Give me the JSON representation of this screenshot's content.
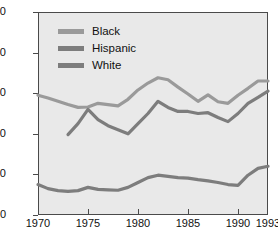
{
  "chart_data": {
    "type": "line",
    "title": "",
    "xlabel": "",
    "ylabel": "Percent of Group Living in Poverty",
    "xlim": [
      1970,
      1993
    ],
    "ylim": [
      0,
      50
    ],
    "yticks": [
      0,
      10,
      20,
      30,
      40,
      50
    ],
    "xticks": [
      1970,
      1975,
      1980,
      1985,
      1990,
      1993
    ],
    "grid": false,
    "legend_position": "top-left",
    "colors": {
      "black": "#9a9a9a",
      "hispanic": "#7d7d7d",
      "white": "#7d7d7d",
      "axis": "#4a4a4a",
      "plot_background": "#e9e9e9",
      "page_background": "#ffffff",
      "text": "#111111"
    },
    "series": [
      {
        "name": "Black",
        "x": [
          1970,
          1971,
          1972,
          1973,
          1974,
          1975,
          1976,
          1977,
          1978,
          1979,
          1980,
          1981,
          1982,
          1983,
          1984,
          1985,
          1986,
          1987,
          1988,
          1989,
          1990,
          1991,
          1992,
          1993
        ],
        "values": [
          29.5,
          28.8,
          28.0,
          27.2,
          26.5,
          26.6,
          27.5,
          27.2,
          26.9,
          28.5,
          30.8,
          32.5,
          33.8,
          33.3,
          31.5,
          29.8,
          28.0,
          29.6,
          27.9,
          27.5,
          29.5,
          31.2,
          33.0,
          33.0
        ]
      },
      {
        "name": "Hispanic",
        "x": [
          1973,
          1974,
          1975,
          1976,
          1977,
          1978,
          1979,
          1980,
          1981,
          1982,
          1983,
          1984,
          1985,
          1986,
          1987,
          1988,
          1989,
          1990,
          1991,
          1992,
          1993
        ],
        "values": [
          19.8,
          22.5,
          26.0,
          23.5,
          22.0,
          21.0,
          20.0,
          22.5,
          25.0,
          28.0,
          26.5,
          25.5,
          25.5,
          25.0,
          25.2,
          24.0,
          23.0,
          25.0,
          27.5,
          29.0,
          30.5
        ]
      },
      {
        "name": "White",
        "x": [
          1970,
          1971,
          1972,
          1973,
          1974,
          1975,
          1976,
          1977,
          1978,
          1979,
          1980,
          1981,
          1982,
          1983,
          1984,
          1985,
          1986,
          1987,
          1988,
          1989,
          1990,
          1991,
          1992,
          1993
        ],
        "values": [
          7.5,
          6.5,
          6.0,
          5.8,
          6.0,
          6.8,
          6.3,
          6.2,
          6.1,
          6.8,
          8.0,
          9.2,
          9.8,
          9.5,
          9.2,
          9.1,
          8.7,
          8.4,
          8.0,
          7.5,
          7.3,
          9.8,
          11.5,
          12.0
        ]
      }
    ]
  },
  "legend": {
    "items": [
      {
        "label": "Black",
        "color": "#9a9a9a"
      },
      {
        "label": "Hispanic",
        "color": "#7d7d7d"
      },
      {
        "label": "White",
        "color": "#7d7d7d"
      }
    ]
  },
  "axes": {
    "y_label": "Percent of Group Living in Poverty",
    "y_ticks": [
      "0",
      "10",
      "20",
      "30",
      "40",
      "50"
    ],
    "x_ticks": [
      "1970",
      "1975",
      "1980",
      "1985",
      "1990",
      "1993"
    ]
  }
}
